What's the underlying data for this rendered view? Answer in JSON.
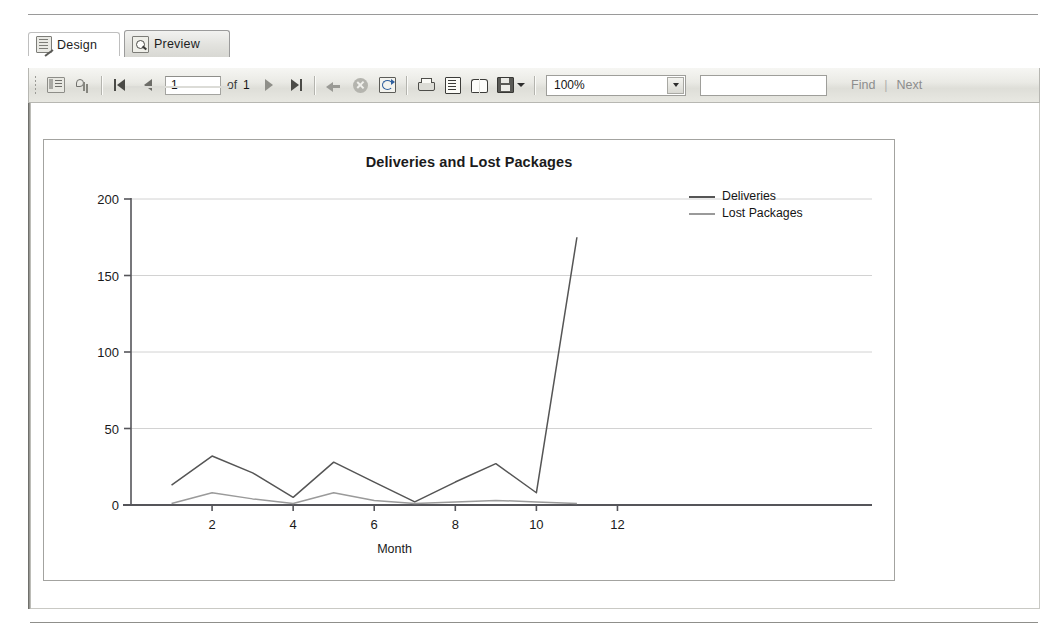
{
  "window": {
    "tabs": [
      {
        "label": "Design",
        "icon": "design-document-icon",
        "active": false
      },
      {
        "label": "Preview",
        "icon": "preview-magnifier-icon",
        "active": true
      }
    ]
  },
  "toolbar": {
    "buttons": [
      {
        "name": "document-map-button",
        "icon": "document-outline-icon"
      },
      {
        "name": "report-parameters-button",
        "icon": "parameters-icon"
      },
      {
        "name": "first-page-button",
        "icon": "first-page-icon"
      },
      {
        "name": "previous-page-button",
        "icon": "previous-page-icon"
      },
      {
        "name": "next-page-button",
        "icon": "next-page-icon"
      },
      {
        "name": "last-page-button",
        "icon": "last-page-icon"
      },
      {
        "name": "back-button",
        "icon": "back-arrow-icon"
      },
      {
        "name": "stop-button",
        "icon": "stop-icon"
      },
      {
        "name": "refresh-button",
        "icon": "refresh-icon"
      },
      {
        "name": "print-button",
        "icon": "print-icon"
      },
      {
        "name": "page-setup-button",
        "icon": "page-layout-icon"
      },
      {
        "name": "print-layout-button",
        "icon": "book-icon"
      },
      {
        "name": "export-button",
        "icon": "save-disk-icon"
      }
    ],
    "page_current": "1",
    "page_of_label": "of",
    "page_total": "1",
    "zoom_value": "100%",
    "find_value": "",
    "find_label": "Find",
    "find_divider": "|",
    "next_label": "Next"
  },
  "chart_data": {
    "type": "line",
    "title": "Deliveries and Lost Packages",
    "xlabel": "Month",
    "ylabel": "",
    "x": [
      1,
      2,
      3,
      4,
      5,
      6,
      7,
      8,
      9,
      10,
      11
    ],
    "xlim": [
      0,
      13
    ],
    "ylim": [
      0,
      200
    ],
    "xticks": [
      2,
      4,
      6,
      8,
      10,
      12
    ],
    "yticks": [
      0,
      50,
      100,
      150,
      200
    ],
    "grid": true,
    "legend_position": "top-right",
    "series": [
      {
        "name": "Deliveries",
        "color": "#555555",
        "values": [
          13,
          32,
          21,
          5,
          28,
          15,
          2,
          15,
          27,
          8,
          175
        ]
      },
      {
        "name": "Lost Packages",
        "color": "#9a9a9a",
        "values": [
          1,
          8,
          4,
          1,
          8,
          3,
          1,
          2,
          3,
          2,
          1
        ]
      }
    ]
  }
}
